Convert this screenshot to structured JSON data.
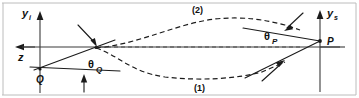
{
  "figure": {
    "kind": "ray-path-diagram",
    "background_color": "#ffffff",
    "ink_color": "#1b1b1b",
    "axis_color": "#3a3a3a"
  },
  "axes": {
    "left": {
      "vertical_label": "y",
      "vertical_subscript": "i",
      "horizontal_label": "z",
      "horizontal_arrow_direction": "left",
      "vertical_arrow_direction": "up"
    },
    "right": {
      "vertical_label": "y",
      "vertical_subscript": "s",
      "vertical_arrow_direction": "up"
    }
  },
  "points": [
    {
      "name": "Q",
      "label": "Q",
      "role": "source-point",
      "x": 40,
      "y": 69
    },
    {
      "name": "P",
      "label": "P",
      "role": "observation-point",
      "x": 320,
      "y": 40
    }
  ],
  "angles": [
    {
      "name": "theta-Q",
      "symbol": "θ",
      "subscript": "Q",
      "at_point": "Q",
      "label_x": 95,
      "label_y": 68
    },
    {
      "name": "theta-P",
      "symbol": "θ",
      "subscript": "P",
      "at_point": "P",
      "label_x": 271,
      "label_y": 40
    }
  ],
  "branches": [
    {
      "name": "branch-2",
      "label": "(2)",
      "position": "upper",
      "label_x": 198,
      "label_y": 13
    },
    {
      "name": "branch-1",
      "label": "(1)",
      "position": "lower",
      "label_x": 200,
      "label_y": 88
    }
  ],
  "style": {
    "dash_pattern": "5 3.2",
    "stroke_width": 1.1
  }
}
